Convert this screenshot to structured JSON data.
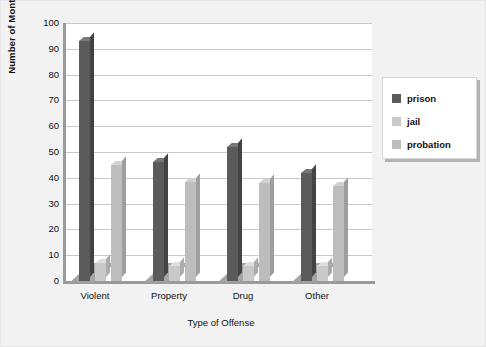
{
  "chart_data": {
    "type": "bar",
    "title": "",
    "xlabel": "Type of Offense",
    "ylabel": "Number of Months",
    "categories": [
      "Violent",
      "Property",
      "Drug",
      "Other"
    ],
    "series": [
      {
        "name": "prison",
        "color": "#5b5b5b",
        "values": [
          93,
          46,
          52,
          42
        ]
      },
      {
        "name": "jail",
        "color": "#c9c9c9",
        "values": [
          7,
          6,
          6,
          6
        ]
      },
      {
        "name": "probation",
        "color": "#bdbdbd",
        "values": [
          45,
          38.5,
          38,
          37
        ]
      }
    ],
    "ylim": [
      0,
      100
    ],
    "ytick_step": 10,
    "yticks": [
      "100",
      "90",
      "80",
      "70",
      "60",
      "50",
      "40",
      "30",
      "20",
      "10",
      "0"
    ],
    "grid": true,
    "grid_axis": "y",
    "legend_position": "right",
    "three_d": true
  },
  "legend": {
    "items": [
      {
        "label": "prison"
      },
      {
        "label": "jail"
      },
      {
        "label": "probation"
      }
    ]
  },
  "axes": {
    "y_title": "Number of Months",
    "x_title": "Type of Offense"
  },
  "colors": {
    "background": "#f2f2f2",
    "plot_background": "#ffffff",
    "gridline": "#c9c9c9",
    "axis": "#9a9a9a",
    "prison": "#5b5b5b",
    "jail": "#c9c9c9",
    "probation": "#bdbdbd"
  }
}
